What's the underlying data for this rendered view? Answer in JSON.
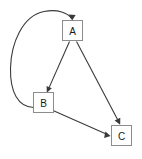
{
  "diagram": {
    "type": "directed-graph",
    "title": "",
    "canvas": {
      "width": 142,
      "height": 159,
      "background": "#ffffff"
    },
    "style": {
      "node_fill": "#ffffff",
      "node_stroke": "#8c8c8c",
      "edge_color": "#3a3a3a",
      "label_color": "#1a1a1a"
    },
    "nodes": [
      {
        "id": "A",
        "label": "A",
        "x": 62,
        "y": 20,
        "width": 21,
        "height": 21
      },
      {
        "id": "B",
        "label": "B",
        "x": 33,
        "y": 92,
        "width": 21,
        "height": 21
      },
      {
        "id": "C",
        "label": "C",
        "x": 111,
        "y": 125,
        "width": 21,
        "height": 21
      }
    ],
    "edges": [
      {
        "id": "edge-a-b",
        "from": "A",
        "to": "B",
        "shape": "straight",
        "label": ""
      },
      {
        "id": "edge-a-c",
        "from": "A",
        "to": "C",
        "shape": "straight",
        "label": ""
      },
      {
        "id": "edge-b-c",
        "from": "B",
        "to": "C",
        "shape": "straight",
        "label": ""
      },
      {
        "id": "edge-b-a",
        "from": "B",
        "to": "A",
        "shape": "curved",
        "label": ""
      }
    ]
  }
}
